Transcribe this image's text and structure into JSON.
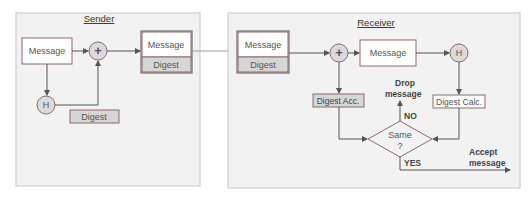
{
  "sender": {
    "title": "Sender",
    "message_label": "Message",
    "plus_symbol": "+",
    "hash_symbol": "H",
    "digest_label": "Digest",
    "packet": {
      "message": "Message",
      "digest": "Digest"
    }
  },
  "receiver": {
    "title": "Receiver",
    "packet": {
      "message": "Message",
      "digest": "Digest"
    },
    "plus_symbol": "+",
    "message_label": "Message",
    "hash_symbol": "H",
    "digest_acc_label": "Digest Acc.",
    "digest_calc_label": "Digest Calc.",
    "decision": {
      "line1": "Same",
      "line2": "?"
    },
    "drop": {
      "line1": "Drop",
      "line2": "message"
    },
    "accept": {
      "line1": "Accept",
      "line2": "message"
    },
    "no_label": "NO",
    "yes_label": "YES"
  }
}
